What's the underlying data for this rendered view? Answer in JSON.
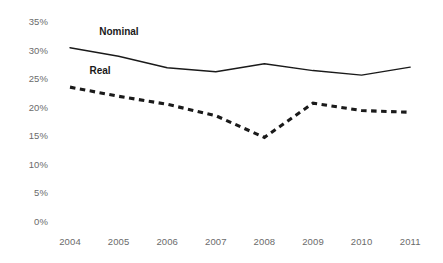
{
  "chart_data": {
    "type": "line",
    "title": "",
    "xlabel": "",
    "ylabel": "",
    "categories": [
      "2004",
      "2005",
      "2006",
      "2007",
      "2008",
      "2009",
      "2010",
      "2011"
    ],
    "x": [
      2004,
      2005,
      2006,
      2007,
      2008,
      2009,
      2010,
      2011
    ],
    "ylim": [
      0,
      35
    ],
    "ytick_labels": [
      "35%",
      "30%",
      "25%",
      "20%",
      "15%",
      "10%",
      "5%",
      "0%"
    ],
    "ytick_values": [
      35,
      30,
      25,
      20,
      15,
      10,
      5,
      0
    ],
    "grid": false,
    "legend_position": "inline-annotations",
    "series": [
      {
        "name": "Nominal",
        "style": "solid",
        "color": "#1a1a1a",
        "values": [
          30.5,
          29.0,
          27.0,
          26.3,
          27.7,
          26.5,
          25.7,
          27.1
        ],
        "label_x": 2004.6,
        "label_y": 33.4
      },
      {
        "name": "Real",
        "style": "dashed",
        "color": "#1a1a1a",
        "values": [
          23.6,
          22.0,
          20.6,
          18.6,
          14.8,
          20.8,
          19.5,
          19.2
        ],
        "label_x": 2004.4,
        "label_y": 26.6
      }
    ]
  },
  "axes": {
    "y_labels": [
      "35%",
      "30%",
      "25%",
      "20%",
      "15%",
      "10%",
      "5%",
      "0%"
    ],
    "x_labels": [
      "2004",
      "2005",
      "2006",
      "2007",
      "2008",
      "2009",
      "2010",
      "2011"
    ]
  }
}
